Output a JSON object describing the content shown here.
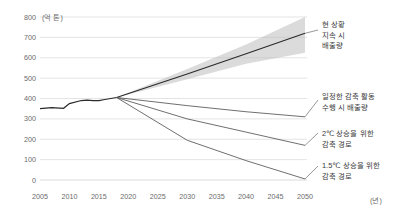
{
  "chart_data": {
    "type": "line",
    "title": "",
    "subtitle": "",
    "xlabel": "년",
    "ylabel": "억 톤",
    "y_unit_label": "(억 톤)",
    "x_unit_label": "(년)",
    "xlim": [
      2005,
      2050
    ],
    "ylim": [
      0,
      800
    ],
    "grid": true,
    "legend_position": "right-annotations",
    "yticks": [
      "800",
      "700",
      "600",
      "500",
      "400",
      "300",
      "200",
      "100",
      "0"
    ],
    "ytick_values": [
      800,
      700,
      600,
      500,
      400,
      300,
      200,
      100,
      0
    ],
    "xticks": [
      "2005",
      "2010",
      "2015",
      "2020",
      "2025",
      "2030",
      "2035",
      "2040",
      "2045",
      "2050"
    ],
    "xtick_values": [
      2005,
      2010,
      2015,
      2020,
      2025,
      2030,
      2035,
      2040,
      2045,
      2050
    ],
    "series": [
      {
        "name": "역사적 배출량",
        "label": "",
        "x": [
          2005,
          2007,
          2009,
          2010,
          2012,
          2013,
          2014,
          2015,
          2016,
          2018
        ],
        "values": [
          350,
          355,
          352,
          375,
          390,
          392,
          390,
          390,
          395,
          405
        ]
      },
      {
        "name": "현 상황 지속 시 배출량",
        "label": "현 상황\n지속 시\n배출량",
        "x": [
          2018,
          2030,
          2040,
          2050
        ],
        "values": [
          405,
          520,
          620,
          720
        ]
      },
      {
        "name": "현 상황 지속 시 배출량 (상한)",
        "label": "",
        "x": [
          2018,
          2030,
          2040,
          2050
        ],
        "values": [
          405,
          545,
          665,
          800
        ]
      },
      {
        "name": "현 상황 지속 시 배출량 (하한)",
        "label": "",
        "x": [
          2018,
          2030,
          2040,
          2050
        ],
        "values": [
          405,
          495,
          570,
          625
        ]
      },
      {
        "name": "일정한 감축 활동 수행 시 배출량",
        "label": "일정한 감축 활동\n수행 시 배출량",
        "x": [
          2018,
          2030,
          2040,
          2050
        ],
        "values": [
          405,
          365,
          335,
          310
        ]
      },
      {
        "name": "2℃ 상승을 위한 감축 경로",
        "label": "2℃ 상승을 위한\n감축 경로",
        "x": [
          2018,
          2030,
          2040,
          2050
        ],
        "values": [
          405,
          300,
          235,
          170
        ]
      },
      {
        "name": "1.5℃ 상승을 위한 감축 경로",
        "label": "1.5℃ 상승을 위한\n감축 경로",
        "x": [
          2018,
          2030,
          2040,
          2050
        ],
        "values": [
          405,
          195,
          95,
          5
        ]
      }
    ],
    "annotations": [
      {
        "id": "bau",
        "lines": [
          "현 상황",
          "지속 시",
          "배출량"
        ]
      },
      {
        "id": "steady-reduction",
        "lines": [
          "일정한 감축 활동",
          "수행 시 배출량"
        ]
      },
      {
        "id": "two-degree",
        "lines": [
          "2℃ 상승을 위한",
          "감축 경로"
        ]
      },
      {
        "id": "one-point-five-degree",
        "lines": [
          "1.5℃ 상승을 위한",
          "감축 경로"
        ]
      }
    ],
    "colors": {
      "line": "#2b2b2b",
      "thin_line": "#555555",
      "cone": "#bdbdbd",
      "grid": "#d9d9d9",
      "text": "#4a4a4a"
    }
  }
}
